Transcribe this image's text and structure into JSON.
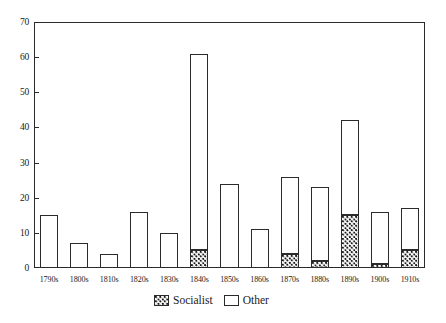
{
  "chart_data": {
    "type": "bar",
    "title": "",
    "subtitle": "",
    "xlabel": "",
    "ylabel": "",
    "stacked": true,
    "grid": false,
    "legend_position": "bottom-center",
    "ylim": [
      0,
      70
    ],
    "ytick_values": [
      0,
      10,
      20,
      30,
      40,
      50,
      60,
      70
    ],
    "ytick_labels": [
      "0",
      "10",
      "20",
      "30",
      "40",
      "50",
      "60",
      "70"
    ],
    "categories": [
      "1790s",
      "1800s",
      "1810s",
      "1820s",
      "1830s",
      "1840s",
      "1850s",
      "1860s",
      "1870s",
      "1880s",
      "1890s",
      "1900s",
      "1910s"
    ],
    "series": [
      {
        "name": "Socialist",
        "color": "#ffffff",
        "pattern": "checkered-dots",
        "values": [
          0,
          0,
          0,
          0,
          0,
          5,
          0,
          0,
          4,
          2,
          15,
          1,
          5
        ]
      },
      {
        "name": "Other",
        "color": "#ffffff",
        "pattern": "solid-outline",
        "values": [
          15,
          7,
          4,
          16,
          10,
          56,
          24,
          11,
          22,
          21,
          27,
          15,
          12
        ]
      }
    ],
    "totals": [
      15,
      7,
      4,
      16,
      10,
      61,
      24,
      11,
      26,
      23,
      42,
      16,
      17
    ]
  },
  "legend": {
    "items": [
      {
        "label": "Socialist",
        "swatch": "socialist-swatch-icon"
      },
      {
        "label": "Other",
        "swatch": "other-swatch-icon"
      }
    ]
  },
  "colors": {
    "axis": "#2b2b2b",
    "text": "#1a1a1a",
    "background": "#ffffff"
  }
}
